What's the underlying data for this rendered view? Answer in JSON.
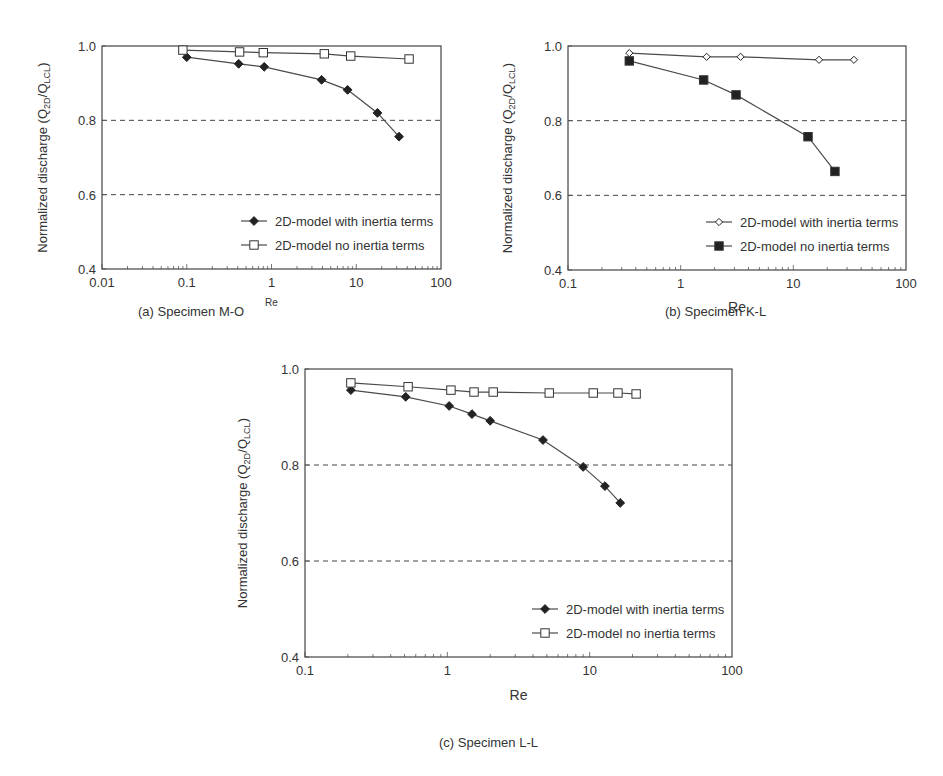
{
  "figure": {
    "captions": {
      "a": "(a) Specimen M-O",
      "b": "(b) Specimen K-L",
      "c": "(c) Specimen L-L"
    }
  },
  "chart_data": [
    {
      "id": "a",
      "type": "line",
      "title": "(a) Specimen M-O",
      "xlabel": "Re",
      "ylabel": "Normalized discharge (Q2D/QLCL)",
      "xscale": "log",
      "xlim": [
        0.01,
        100
      ],
      "ylim": [
        0.4,
        1.0
      ],
      "xticks": [
        "0.01",
        "0.1",
        "1",
        "10",
        "100"
      ],
      "yticks": [
        "0.4",
        "0.6",
        "0.8",
        "1.0"
      ],
      "hlines_dashed": [
        0.6,
        0.8
      ],
      "legend_position": "lower right",
      "series": [
        {
          "name": "2D-model with inertia terms",
          "marker": "filled-diamond",
          "x": [
            0.1,
            0.41,
            0.82,
            3.9,
            7.9,
            17.8,
            32
          ],
          "y": [
            0.97,
            0.952,
            0.944,
            0.909,
            0.882,
            0.82,
            0.756
          ]
        },
        {
          "name": "2D-model no inertia terms",
          "marker": "open-square",
          "x": [
            0.09,
            0.42,
            0.8,
            4.2,
            8.6,
            42
          ],
          "y": [
            0.989,
            0.984,
            0.982,
            0.979,
            0.973,
            0.965
          ]
        }
      ]
    },
    {
      "id": "b",
      "type": "line",
      "title": "(b) Specimen K-L",
      "xlabel": "Re",
      "ylabel": "Normalized discharge (Q2D/QLCL)",
      "xscale": "log",
      "xlim": [
        0.1,
        100
      ],
      "ylim": [
        0.4,
        1.0
      ],
      "xticks": [
        "0.1",
        "1",
        "10",
        "100"
      ],
      "yticks": [
        "0.4",
        "0.6",
        "0.8",
        "1.0"
      ],
      "hlines_dashed": [
        0.6,
        0.8
      ],
      "legend_position": "lower right",
      "series": [
        {
          "name": "2D-model with inertia terms",
          "marker": "open-diamond",
          "x": [
            0.35,
            1.7,
            3.4,
            16.9,
            34.5
          ],
          "y": [
            0.981,
            0.971,
            0.971,
            0.963,
            0.963
          ]
        },
        {
          "name": "2D-model no inertia terms",
          "marker": "filled-square",
          "x": [
            0.35,
            1.6,
            3.1,
            13.5,
            23.4
          ],
          "y": [
            0.96,
            0.909,
            0.869,
            0.757,
            0.664
          ]
        }
      ]
    },
    {
      "id": "c",
      "type": "line",
      "title": "(c) Specimen L-L",
      "xlabel": "Re",
      "ylabel": "Normalized discharge (Q2D/QLCL)",
      "xscale": "log",
      "xlim": [
        0.1,
        100
      ],
      "ylim": [
        0.4,
        1.0
      ],
      "xticks": [
        "0.1",
        "1",
        "10",
        "100"
      ],
      "yticks": [
        "0.4",
        "0.6",
        "0.8",
        "1.0"
      ],
      "hlines_dashed": [
        0.6,
        0.8
      ],
      "legend_position": "lower right",
      "series": [
        {
          "name": "2D-model with inertia terms",
          "marker": "filled-diamond",
          "x": [
            0.21,
            0.51,
            1.03,
            1.49,
            2.0,
            4.7,
            9.0,
            12.8,
            16.4
          ],
          "y": [
            0.956,
            0.942,
            0.923,
            0.906,
            0.892,
            0.852,
            0.796,
            0.756,
            0.721
          ]
        },
        {
          "name": "2D-model no inertia terms",
          "marker": "open-square",
          "x": [
            0.21,
            0.53,
            1.06,
            1.54,
            2.1,
            5.2,
            10.6,
            15.8,
            21.2
          ],
          "y": [
            0.971,
            0.963,
            0.956,
            0.952,
            0.952,
            0.95,
            0.95,
            0.95,
            0.948
          ]
        }
      ]
    }
  ],
  "layout": {
    "a": {
      "left": 102,
      "top": 46,
      "right": 441,
      "bottom": 269,
      "ylabel_x": 47,
      "tick_font": 13,
      "xlabel_font": 10,
      "xlabel_y": 306
    },
    "b": {
      "left": 568,
      "top": 46,
      "right": 906,
      "bottom": 270,
      "ylabel_x": 512,
      "tick_font": 13,
      "xlabel_font": 14,
      "xlabel_y": 312
    },
    "c": {
      "left": 305,
      "top": 369,
      "right": 732,
      "bottom": 657,
      "ylabel_x": 247,
      "tick_font": 13,
      "xlabel_font": 14,
      "xlabel_y": 700
    }
  }
}
